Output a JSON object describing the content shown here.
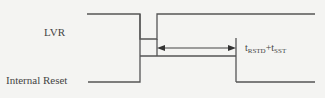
{
  "diagram": {
    "signals": [
      {
        "name": "LVR"
      },
      {
        "name": "Internal Reset"
      }
    ],
    "timing": {
      "t1": "t",
      "t1_sub": "RSTD",
      "plus": "+",
      "t2": "t",
      "t2_sub": "SST"
    },
    "colors": {
      "line": "#555555",
      "background": "#f4f4f2"
    }
  }
}
